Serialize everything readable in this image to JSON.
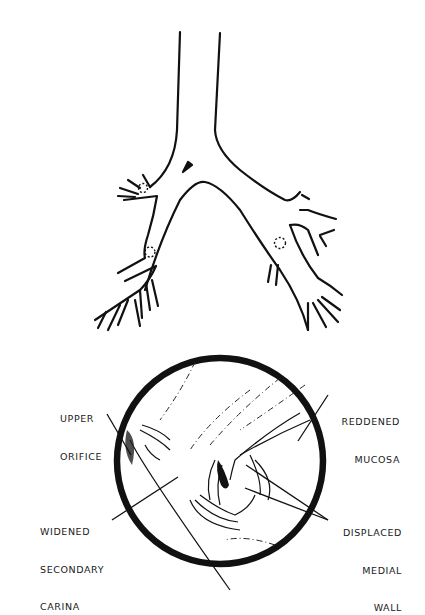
{
  "figure": {
    "type": "medical-illustration",
    "panels": [
      {
        "id": "bronchial-tree",
        "description": "Schematic of trachea and bronchial tree with arrow pointing at carina and dotted circles marking orifices"
      },
      {
        "id": "bronchoscopic-view",
        "description": "Circular bronchoscopic view of secondary carina"
      }
    ],
    "colors": {
      "ink": "#111111",
      "background": "#ffffff"
    }
  },
  "labels": {
    "upper_orifice": {
      "line1": "UPPER",
      "line2": "ORIFICE"
    },
    "reddened_mucosa": {
      "line1": "REDDENED",
      "line2": "MUCOSA"
    },
    "widened_secondary_carina": {
      "line1": "WIDENED",
      "line2": "SECONDARY",
      "line3": "CARINA"
    },
    "displaced_medial_wall": {
      "line1": "DISPLACED",
      "line2": "MEDIAL",
      "line3": "WALL"
    }
  }
}
